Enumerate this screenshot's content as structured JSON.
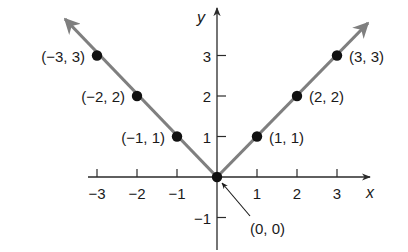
{
  "chart_data": {
    "type": "line",
    "title": "",
    "function": "y = |x|",
    "xlabel": "x",
    "ylabel": "y",
    "xlim": [
      -3.3,
      3.8
    ],
    "ylim": [
      -1.8,
      4.0
    ],
    "grid": false,
    "x_ticks": [
      -3,
      -2,
      -1,
      1,
      2,
      3
    ],
    "x_tick_labels": [
      "−3",
      "−2",
      "−1",
      "1",
      "2",
      "3"
    ],
    "y_ticks": [
      -1,
      1,
      2,
      3
    ],
    "y_tick_labels": [
      "−1",
      "1",
      "2",
      "3"
    ],
    "series": [
      {
        "name": "y = |x|",
        "color": "#7f7f7f",
        "x": [
          -3,
          -2,
          -1,
          0,
          1,
          2,
          3
        ],
        "y": [
          3,
          2,
          1,
          0,
          1,
          2,
          3
        ]
      }
    ],
    "points": [
      {
        "x": -3,
        "y": 3,
        "label": "(−3, 3)"
      },
      {
        "x": -2,
        "y": 2,
        "label": "(−2, 2)"
      },
      {
        "x": -1,
        "y": 1,
        "label": "(−1, 1)"
      },
      {
        "x": 0,
        "y": 0,
        "label": "(0, 0)"
      },
      {
        "x": 1,
        "y": 1,
        "label": "(1, 1)"
      },
      {
        "x": 2,
        "y": 2,
        "label": "(2, 2)"
      },
      {
        "x": 3,
        "y": 3,
        "label": "(3, 3)"
      }
    ],
    "annotations": [
      {
        "text": "(0, 0)",
        "points_to": [
          0,
          0
        ],
        "arrow": true
      }
    ]
  },
  "colors": {
    "line": "#7f7f7f",
    "axis": "#2a2a2a",
    "point": "#111111"
  }
}
